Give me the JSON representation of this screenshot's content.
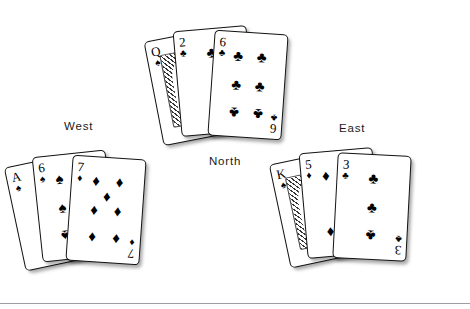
{
  "figure": {
    "background_color": "#ffffff",
    "ink_color": "#000000",
    "divider_color": "#9b9fa4"
  },
  "suits": {
    "spade": {
      "name": "spade-suit",
      "glyph": "♠",
      "color": "#000000"
    },
    "heart": {
      "name": "heart-suit",
      "glyph": "♥",
      "color": "#000000"
    },
    "diamond": {
      "name": "diamond-suit",
      "glyph": "♦",
      "color": "#000000"
    },
    "club": {
      "name": "club-suit",
      "glyph": "♣",
      "color": "#000000"
    }
  },
  "seats": {
    "west": {
      "label": "West"
    },
    "north": {
      "label": "North"
    },
    "east": {
      "label": "East"
    }
  },
  "hands": {
    "west": {
      "seat_label": "West",
      "cards": [
        {
          "rank": "A",
          "suit": "spade",
          "suit_glyph": "♠",
          "label": "A♠",
          "is_face": false,
          "pip_count": 1,
          "rotation_deg": -12,
          "offset_x": -45,
          "offset_y": 6
        },
        {
          "rank": "6",
          "suit": "spade",
          "suit_glyph": "♠",
          "label": "6♠",
          "is_face": false,
          "pip_count": 6,
          "rotation_deg": -6,
          "offset_x": -22,
          "offset_y": 0
        },
        {
          "rank": "7",
          "suit": "diamond",
          "suit_glyph": "♦",
          "label": "7♦",
          "is_face": false,
          "pip_count": 7,
          "rotation_deg": 4,
          "offset_x": 10,
          "offset_y": 4
        }
      ]
    },
    "north": {
      "seat_label": "North",
      "cards": [
        {
          "rank": "Q",
          "suit": "spade",
          "suit_glyph": "♠",
          "label": "Q♠",
          "is_face": true,
          "pip_count": 0,
          "rotation_deg": -11,
          "offset_x": -50,
          "offset_y": 4
        },
        {
          "rank": "2",
          "suit": "club",
          "suit_glyph": "♣",
          "label": "2♣",
          "is_face": false,
          "pip_count": 2,
          "rotation_deg": -5,
          "offset_x": -26,
          "offset_y": -2
        },
        {
          "rank": "6",
          "suit": "club",
          "suit_glyph": "♣",
          "label": "6♣",
          "is_face": false,
          "pip_count": 6,
          "rotation_deg": 4,
          "offset_x": 8,
          "offset_y": 2
        }
      ]
    },
    "east": {
      "seat_label": "East",
      "cards": [
        {
          "rank": "K",
          "suit": "spade",
          "suit_glyph": "♠",
          "label": "K♠",
          "is_face": true,
          "pip_count": 0,
          "rotation_deg": -12,
          "offset_x": -48,
          "offset_y": 6
        },
        {
          "rank": "5",
          "suit": "diamond",
          "suit_glyph": "♦",
          "label": "5♦",
          "is_face": false,
          "pip_count": 5,
          "rotation_deg": -5,
          "offset_x": -24,
          "offset_y": 0
        },
        {
          "rank": "3",
          "suit": "club",
          "suit_glyph": "♣",
          "label": "3♣",
          "is_face": false,
          "pip_count": 3,
          "rotation_deg": 3,
          "offset_x": 8,
          "offset_y": 4
        }
      ]
    }
  },
  "pip_layouts": {
    "1": [
      [
        50,
        50
      ]
    ],
    "2": [
      [
        50,
        14
      ],
      [
        50,
        86
      ]
    ],
    "3": [
      [
        50,
        14
      ],
      [
        50,
        50
      ],
      [
        50,
        86
      ]
    ],
    "5": [
      [
        22,
        14
      ],
      [
        78,
        14
      ],
      [
        50,
        50
      ],
      [
        22,
        86
      ],
      [
        78,
        86
      ]
    ],
    "6": [
      [
        22,
        14
      ],
      [
        78,
        14
      ],
      [
        22,
        50
      ],
      [
        78,
        50
      ],
      [
        22,
        86
      ],
      [
        78,
        86
      ]
    ],
    "7": [
      [
        22,
        14
      ],
      [
        78,
        14
      ],
      [
        50,
        32
      ],
      [
        22,
        50
      ],
      [
        78,
        50
      ],
      [
        22,
        86
      ],
      [
        78,
        86
      ]
    ]
  }
}
